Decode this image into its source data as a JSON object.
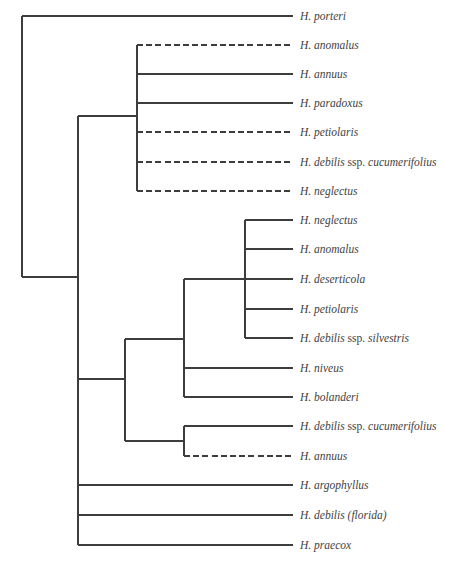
{
  "figure": {
    "type": "phylogenetic_tree",
    "background": "#ffffff",
    "line_color": "#3d3d3d",
    "label_color": "#424242",
    "stroke_width": 1.3,
    "dash_pattern": "6,3.2",
    "canvas": {
      "width": 451,
      "height": 562
    },
    "tip_x": 293,
    "label_x": 300
  },
  "chart_data": {
    "type": "cladogram",
    "orientation": "left-to-right",
    "taxa_top_to_bottom": [
      "H. porteri",
      "H. anomalus",
      "H. annuus",
      "H. paradoxus",
      "H. petiolaris",
      "H. debilis ssp. cucumerifolius",
      "H. neglectus",
      "H. neglectus",
      "H. anomalus",
      "H. deserticola",
      "H. petiolaris",
      "H. debilis ssp. silvestris",
      "H. niveus",
      "H. bolanderi",
      "H. debilis ssp. cucumerifolius",
      "H. annuus",
      "H. argophyllus",
      "H. debilis (florida)",
      "H. praecox"
    ],
    "leaves": [
      {
        "name": "H. porteri",
        "y": 16,
        "x_start": 22,
        "dashed": false,
        "segments": [
          {
            "t": "H. porteri",
            "i": true
          }
        ]
      },
      {
        "name": "H. anomalus",
        "y": 45,
        "x_start": 137,
        "dashed": true,
        "segments": [
          {
            "t": "H. anomalus",
            "i": true
          }
        ]
      },
      {
        "name": "H. annuus",
        "y": 74,
        "x_start": 137,
        "dashed": false,
        "segments": [
          {
            "t": "H. annuus",
            "i": true
          }
        ]
      },
      {
        "name": "H. paradoxus",
        "y": 103,
        "x_start": 137,
        "dashed": false,
        "segments": [
          {
            "t": "H. paradoxus",
            "i": true
          }
        ]
      },
      {
        "name": "H. petiolaris",
        "y": 132,
        "x_start": 137,
        "dashed": true,
        "segments": [
          {
            "t": "H. petiolaris",
            "i": true
          }
        ]
      },
      {
        "name": "H. debilis ssp. cucumerifolius",
        "y": 162,
        "x_start": 137,
        "dashed": true,
        "segments": [
          {
            "t": "H. debilis ",
            "i": true
          },
          {
            "t": "ssp. ",
            "i": false
          },
          {
            "t": "cucumerifolius",
            "i": true
          }
        ]
      },
      {
        "name": "H. neglectus",
        "y": 191,
        "x_start": 137,
        "dashed": true,
        "segments": [
          {
            "t": "H. neglectus",
            "i": true
          }
        ]
      },
      {
        "name": "H. neglectus",
        "y": 220,
        "x_start": 245,
        "dashed": false,
        "segments": [
          {
            "t": "H. neglectus",
            "i": true
          }
        ]
      },
      {
        "name": "H. anomalus",
        "y": 249,
        "x_start": 245,
        "dashed": false,
        "segments": [
          {
            "t": "H. anomalus",
            "i": true
          }
        ]
      },
      {
        "name": "H. deserticola",
        "y": 279,
        "x_start": 245,
        "dashed": false,
        "segments": [
          {
            "t": "H. deserticola",
            "i": true
          }
        ]
      },
      {
        "name": "H. petiolaris",
        "y": 309,
        "x_start": 245,
        "dashed": false,
        "segments": [
          {
            "t": "H. petiolaris",
            "i": true
          }
        ]
      },
      {
        "name": "H. debilis ssp. silvestris",
        "y": 338,
        "x_start": 245,
        "dashed": false,
        "segments": [
          {
            "t": "H. debilis ",
            "i": true
          },
          {
            "t": "ssp. ",
            "i": false
          },
          {
            "t": "silvestris",
            "i": true
          }
        ]
      },
      {
        "name": "H. niveus",
        "y": 368,
        "x_start": 184,
        "dashed": false,
        "segments": [
          {
            "t": "H. niveus",
            "i": true
          }
        ]
      },
      {
        "name": "H. bolanderi",
        "y": 397,
        "x_start": 184,
        "dashed": false,
        "segments": [
          {
            "t": "H. bolanderi",
            "i": true
          }
        ]
      },
      {
        "name": "H. debilis ssp. cucumerifolius",
        "y": 426,
        "x_start": 184,
        "dashed": false,
        "segments": [
          {
            "t": "H. debilis ",
            "i": true
          },
          {
            "t": "ssp. ",
            "i": false
          },
          {
            "t": "cucumerifolius",
            "i": true
          }
        ]
      },
      {
        "name": "H. annuus",
        "y": 456,
        "x_start": 184,
        "dashed": true,
        "segments": [
          {
            "t": "H. annuus",
            "i": true
          }
        ]
      },
      {
        "name": "H. argophyllus",
        "y": 485,
        "x_start": 78,
        "dashed": false,
        "segments": [
          {
            "t": "H. argophyllus",
            "i": true
          }
        ]
      },
      {
        "name": "H. debilis (florida)",
        "y": 515,
        "x_start": 78,
        "dashed": false,
        "segments": [
          {
            "t": "H. debilis (florida)",
            "i": true
          }
        ]
      },
      {
        "name": "H. praecox",
        "y": 545,
        "x_start": 78,
        "dashed": false,
        "segments": [
          {
            "t": "H. praecox",
            "i": true
          }
        ]
      }
    ],
    "edges": [
      {
        "x1": 22,
        "y1": 16,
        "x2": 22,
        "y2": 277,
        "dashed": false
      },
      {
        "x1": 22,
        "y1": 277,
        "x2": 78,
        "y2": 277,
        "dashed": false
      },
      {
        "x1": 78,
        "y1": 116,
        "x2": 78,
        "y2": 545,
        "dashed": false
      },
      {
        "x1": 78,
        "y1": 116,
        "x2": 137,
        "y2": 116,
        "dashed": false
      },
      {
        "x1": 137,
        "y1": 45,
        "x2": 137,
        "y2": 191,
        "dashed": false
      },
      {
        "x1": 78,
        "y1": 379,
        "x2": 125,
        "y2": 379,
        "dashed": false
      },
      {
        "x1": 125,
        "y1": 339,
        "x2": 125,
        "y2": 441,
        "dashed": false
      },
      {
        "x1": 125,
        "y1": 339,
        "x2": 184,
        "y2": 339,
        "dashed": false
      },
      {
        "x1": 184,
        "y1": 279,
        "x2": 184,
        "y2": 397,
        "dashed": false
      },
      {
        "x1": 184,
        "y1": 279,
        "x2": 245,
        "y2": 279,
        "dashed": false
      },
      {
        "x1": 245,
        "y1": 220,
        "x2": 245,
        "y2": 338,
        "dashed": false
      },
      {
        "x1": 125,
        "y1": 441,
        "x2": 184,
        "y2": 441,
        "dashed": false
      },
      {
        "x1": 184,
        "y1": 426,
        "x2": 184,
        "y2": 456,
        "dashed": false
      }
    ]
  }
}
